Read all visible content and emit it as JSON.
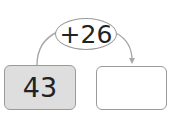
{
  "operation": {
    "label": "+26"
  },
  "start_box": {
    "value": "43"
  },
  "answer_box": {
    "value": ""
  },
  "colors": {
    "start_fill": "#dedede",
    "answer_fill": "#ffffff",
    "stroke": "#9a9a9a",
    "text": "#222222"
  }
}
